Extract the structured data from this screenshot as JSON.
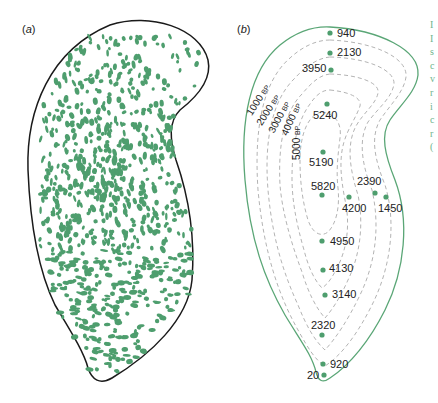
{
  "figure": {
    "panels": [
      {
        "id": "a",
        "label": "a",
        "description": "Outline with dense green blob pattern (vegetation/pattern distribution)"
      },
      {
        "id": "b",
        "label": "b",
        "description": "Outline with dated sample points and dashed isochrone contours"
      }
    ],
    "colors": {
      "green": "#4e9e6e",
      "outline_a": "#1a1a1a",
      "outline_b": "#5aa676",
      "contour_dash": "#aaaaaa",
      "text": "#222222"
    },
    "contour_labels": [
      {
        "value": "1000",
        "unit": "BP"
      },
      {
        "value": "2000",
        "unit": "BP"
      },
      {
        "value": "3000",
        "unit": "BP"
      },
      {
        "value": "4000",
        "unit": "BP"
      },
      {
        "value": "5000",
        "unit": "BP"
      }
    ],
    "sample_points": [
      {
        "age": "940"
      },
      {
        "age": "2130"
      },
      {
        "age": "3950"
      },
      {
        "age": "5240"
      },
      {
        "age": "5190"
      },
      {
        "age": "5820"
      },
      {
        "age": "4200"
      },
      {
        "age": "2390"
      },
      {
        "age": "1450"
      },
      {
        "age": "4950"
      },
      {
        "age": "4130"
      },
      {
        "age": "3140"
      },
      {
        "age": "2320"
      },
      {
        "age": "920"
      },
      {
        "age": "20"
      }
    ],
    "truncated_caption_glyphs": [
      "I",
      "I",
      "s",
      "c",
      "v",
      "r",
      "i",
      "c",
      "r",
      "("
    ]
  }
}
